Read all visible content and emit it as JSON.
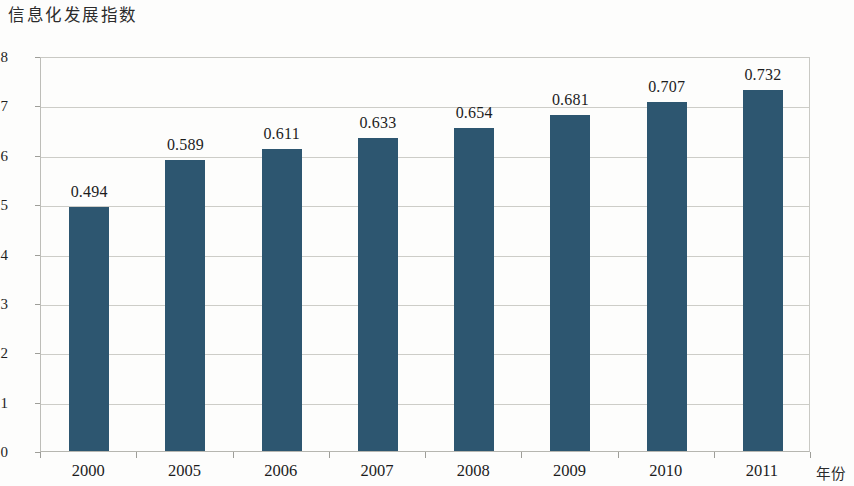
{
  "chart_data": {
    "type": "bar",
    "title": "信息化发展指数",
    "xlabel": "年份",
    "ylabel": "",
    "categories": [
      "2000",
      "2005",
      "2006",
      "2007",
      "2008",
      "2009",
      "2010",
      "2011"
    ],
    "values": [
      0.494,
      0.589,
      0.611,
      0.633,
      0.654,
      0.681,
      0.707,
      0.732
    ],
    "value_labels": [
      "0.494",
      "0.589",
      "0.611",
      "0.633",
      "0.654",
      "0.681",
      "0.707",
      "0.732"
    ],
    "ylim": [
      0,
      0.8
    ],
    "ytick_labels": [
      "0",
      "0.1",
      "0.2",
      "0.3",
      "0.4",
      "0.5",
      "0.6",
      "0.7",
      "0.8"
    ],
    "ytick_values": [
      0,
      0.1,
      0.2,
      0.3,
      0.4,
      0.5,
      0.6,
      0.7,
      0.8
    ],
    "grid": true,
    "legend": null,
    "series_color": "#2d5670",
    "gridline_color": "#cdcdc8",
    "axis_color": "#b6b6b0",
    "background_color": "#fdfdfc"
  }
}
